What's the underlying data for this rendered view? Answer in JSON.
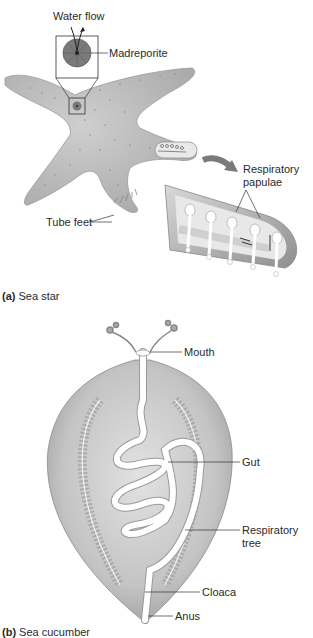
{
  "panel_a": {
    "caption_letter": "(a)",
    "caption_text": "Sea star",
    "labels": {
      "water_flow": "Water flow",
      "madreporite": "Madreporite",
      "respiratory_papulae_1": "Respiratory",
      "respiratory_papulae_2": "papulae",
      "tube_feet": "Tube feet"
    }
  },
  "panel_b": {
    "caption_letter": "(b)",
    "caption_text": "Sea cucumber",
    "labels": {
      "mouth": "Mouth",
      "gut": "Gut",
      "respiratory_tree_1": "Respiratory",
      "respiratory_tree_2": "tree",
      "cloaca": "Cloaca",
      "anus": "Anus"
    }
  },
  "colors": {
    "body_fill": "#b9b9b9",
    "body_light": "#d6d6d6",
    "outline": "#8a8a8a",
    "label_line": "#333333",
    "madreporite": "#7a7a7a"
  }
}
